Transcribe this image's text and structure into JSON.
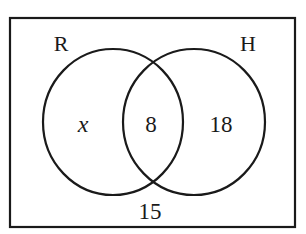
{
  "diagram": {
    "type": "venn",
    "universe": {
      "label": "",
      "outside_value": "15"
    },
    "sets": [
      {
        "name": "R",
        "only_value": "x"
      },
      {
        "name": "H",
        "only_value": "18"
      }
    ],
    "intersection": {
      "sets": [
        "R",
        "H"
      ],
      "value": "8"
    },
    "colors": {
      "stroke": "#1a1a1a",
      "background": "#ffffff"
    }
  }
}
